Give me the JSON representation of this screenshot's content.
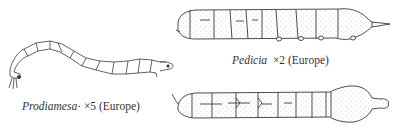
{
  "figures": [
    {
      "id": "prodiamesa",
      "genus": "Prodiamesa",
      "separator": "·",
      "magnification": "×5",
      "region": "(Europe)"
    },
    {
      "id": "pedicia",
      "genus": "Pedicia",
      "magnification": "×2",
      "region": "(Europe)",
      "views": [
        "dorsal-lateral",
        "ventral"
      ]
    }
  ],
  "colors": {
    "ink": "#3a3a3a",
    "background": "#ffffff",
    "stipple": "#8a8a8a"
  }
}
